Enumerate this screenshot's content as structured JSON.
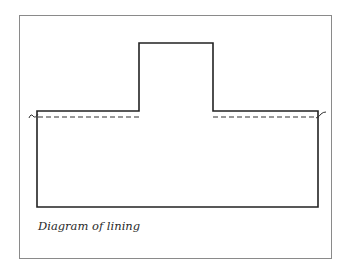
{
  "figure": {
    "caption": "Diagram of lining",
    "colors": {
      "frame": "#8a8a8a",
      "outline": "#222222",
      "dashed": "#333333",
      "background": "#ffffff"
    },
    "elements": [
      {
        "name": "outer-frame",
        "type": "rectangle",
        "stroke": "thin gray"
      },
      {
        "name": "garment-outline",
        "type": "stepped-shape",
        "description": "wide base with raised central tab"
      },
      {
        "name": "lining-line-left",
        "type": "dashed-line"
      },
      {
        "name": "lining-line-right",
        "type": "dashed-line"
      },
      {
        "name": "break-mark-left",
        "type": "tilde"
      },
      {
        "name": "break-mark-right",
        "type": "tilde"
      }
    ]
  }
}
